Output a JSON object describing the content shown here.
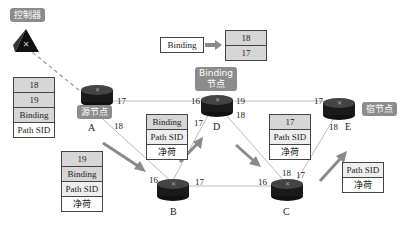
{
  "labels": {
    "controller": "控制器",
    "source_node": "源节点",
    "binding_node_line1": "Binding",
    "binding_node_line2": "节点",
    "destination_node": "宿节点"
  },
  "binding_mapping": {
    "from": "Binding",
    "to": [
      "18",
      "17"
    ]
  },
  "nodes": {
    "A": "A",
    "B": "B",
    "C": "C",
    "D": "D",
    "E": "E"
  },
  "ports": {
    "A_17": "17",
    "A_18": "18",
    "D_16": "16",
    "D_19": "19",
    "D_18": "18",
    "D_17": "17",
    "E_17": "17",
    "E_18": "18",
    "B_16": "16",
    "B_17": "17",
    "C_16": "16",
    "C_18": "18",
    "C_17": "17"
  },
  "stacks": {
    "at_A": [
      "18",
      "19",
      "Binding",
      "Path SID"
    ],
    "A_to_B": [
      "19",
      "Binding",
      "Path SID",
      "净荷"
    ],
    "B_to_D": [
      "Binding",
      "Path SID",
      "净荷"
    ],
    "D_to_C": [
      "17",
      "Path SID",
      "净荷"
    ],
    "C_to_E": [
      "Path SID",
      "净荷"
    ]
  },
  "colors": {
    "label_bg": "#8c8c8c",
    "stack_gray": "#d6d6d6",
    "arrow": "#8a8a8a",
    "link": "#9a9a9a"
  }
}
